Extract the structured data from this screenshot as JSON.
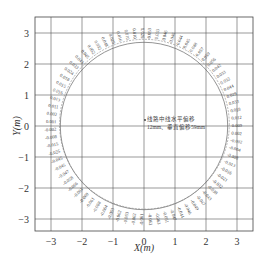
{
  "chart_data": {
    "type": "scatter",
    "title": "",
    "xlabel": "X(m)",
    "ylabel": "Y(m)",
    "xlim": [
      -3.5,
      3.5
    ],
    "ylim": [
      -3.5,
      3.5
    ],
    "xticks": [
      -3,
      -2,
      -1,
      0,
      1,
      2,
      3
    ],
    "yticks": [
      -3,
      -2,
      -1,
      0,
      1,
      2,
      3
    ],
    "grid": true,
    "design_radius": 2.7,
    "annotation": {
      "line1": "线路中线水平偏移",
      "line2": "12mm、垂直偏移59mm",
      "x": 0.0,
      "y": 0.2
    },
    "deviation_labels": [
      "0.010",
      "0.026",
      "0.053",
      "0.033",
      "0.046",
      "0.046",
      "0.044",
      "0.045",
      "0.048",
      "0.057",
      "0.059",
      "0.056",
      "0.042",
      "0.033",
      "0.032",
      "0.044",
      "0.029",
      "0.033",
      "0.018",
      "0.012",
      "0.009",
      "0.002",
      "-0.002",
      "-0.004",
      "-0.008",
      "-0.013",
      "-0.016",
      "-0.021",
      "-0.032",
      "-0.038",
      "-0.043",
      "-0.047",
      "-0.049",
      "-0.046",
      "-0.044",
      "-0.047",
      "-0.051",
      "-0.063",
      "-0.062",
      "-0.061",
      "-0.062",
      "-0.063",
      "-0.062",
      "-0.063",
      "-0.064",
      "-0.068",
      "-0.061",
      "-0.069",
      "-0.061",
      "-0.066",
      "-0.058",
      "-0.047",
      "-0.045",
      "-0.045",
      "-0.025",
      "-0.015",
      "-0.008",
      "-0.002",
      "0.001",
      "0.002",
      "0.011",
      "0.013",
      "0.016",
      "0.015",
      "0.018",
      "0.024",
      "0.033",
      "0.043",
      "0.045",
      "0.052",
      "0.032",
      "0.048",
      "0.029",
      "0.016",
      "0.010"
    ]
  }
}
